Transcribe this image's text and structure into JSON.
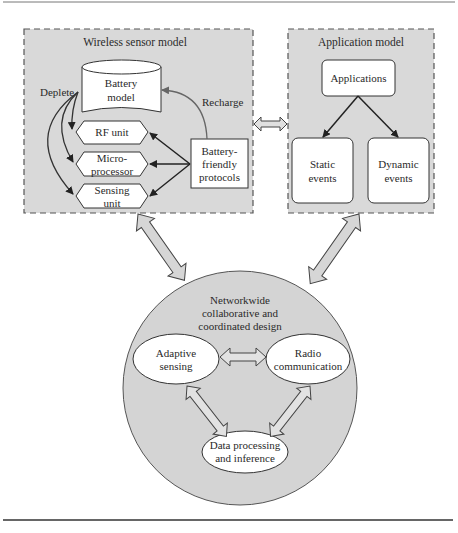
{
  "colors": {
    "panel_fill": "#d9d9d9",
    "panel_border": "#555555",
    "node_fill": "#ffffff",
    "stroke": "#333333",
    "arrow_fill": "#d6d6d6",
    "circle_fill": "#d4d4d4",
    "rule": "#444444"
  },
  "wireless_model": {
    "title": "Wireless sensor model",
    "battery": [
      "Battery",
      "model"
    ],
    "deplete_label": "Deplete",
    "recharge_label": "Recharge",
    "units": [
      {
        "lines": [
          "RF unit"
        ]
      },
      {
        "lines": [
          "Micro-",
          "processor"
        ]
      },
      {
        "lines": [
          "Sensing",
          "unit"
        ]
      }
    ],
    "protocols": [
      "Battery-",
      "friendly",
      "protocols"
    ]
  },
  "application_model": {
    "title": "Application model",
    "applications": "Applications",
    "static_events": [
      "Static",
      "events"
    ],
    "dynamic_events": [
      "Dynamic",
      "events"
    ]
  },
  "network_design": {
    "title": [
      "Networkwide",
      "collaborative and",
      "coordinated design"
    ],
    "adaptive_sensing": [
      "Adaptive",
      "sensing"
    ],
    "radio_communication": [
      "Radio",
      "communication"
    ],
    "data_processing": [
      "Data processing",
      "and inference"
    ]
  }
}
